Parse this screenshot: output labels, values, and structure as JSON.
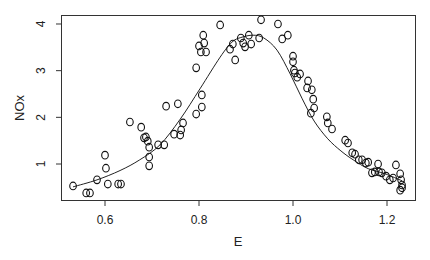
{
  "chart_data": {
    "type": "scatter",
    "title": "",
    "xlabel": "E",
    "ylabel": "NOx",
    "xlim": [
      0.52,
      1.26
    ],
    "ylim": [
      0.21,
      4.17
    ],
    "grid": false,
    "legend": null,
    "x_ticks": [
      0.6,
      0.8,
      1.0,
      1.2
    ],
    "x_tick_labels": [
      "0.6",
      "0.8",
      "1.0",
      "1.2"
    ],
    "y_ticks": [
      1,
      2,
      3,
      4
    ],
    "y_tick_labels": [
      "1",
      "2",
      "3",
      "4"
    ],
    "marker": "open-circle",
    "series": [
      {
        "name": "observations",
        "points": [
          [
            0.532,
            0.53
          ],
          [
            0.56,
            0.38
          ],
          [
            0.568,
            0.38
          ],
          [
            0.583,
            0.66
          ],
          [
            0.6,
            1.19
          ],
          [
            0.602,
            0.91
          ],
          [
            0.606,
            0.57
          ],
          [
            0.628,
            0.57
          ],
          [
            0.634,
            0.57
          ],
          [
            0.653,
            1.9
          ],
          [
            0.677,
            1.79
          ],
          [
            0.683,
            1.56
          ],
          [
            0.687,
            1.58
          ],
          [
            0.691,
            1.49
          ],
          [
            0.694,
            1.36
          ],
          [
            0.694,
            1.15
          ],
          [
            0.694,
            0.96
          ],
          [
            0.713,
            1.41
          ],
          [
            0.726,
            1.41
          ],
          [
            0.73,
            2.24
          ],
          [
            0.747,
            1.64
          ],
          [
            0.755,
            2.29
          ],
          [
            0.76,
            1.62
          ],
          [
            0.762,
            1.73
          ],
          [
            0.766,
            1.88
          ],
          [
            0.794,
            2.07
          ],
          [
            0.806,
            2.22
          ],
          [
            0.806,
            2.48
          ],
          [
            0.794,
            3.06
          ],
          [
            0.8,
            3.53
          ],
          [
            0.804,
            3.4
          ],
          [
            0.809,
            3.76
          ],
          [
            0.811,
            3.59
          ],
          [
            0.815,
            3.4
          ],
          [
            0.845,
            3.98
          ],
          [
            0.866,
            3.46
          ],
          [
            0.872,
            3.57
          ],
          [
            0.877,
            3.23
          ],
          [
            0.889,
            3.7
          ],
          [
            0.894,
            3.59
          ],
          [
            0.898,
            3.51
          ],
          [
            0.906,
            3.76
          ],
          [
            0.911,
            3.57
          ],
          [
            0.928,
            3.7
          ],
          [
            0.932,
            4.09
          ],
          [
            0.968,
            4.0
          ],
          [
            0.977,
            3.68
          ],
          [
            0.989,
            3.76
          ],
          [
            1.0,
            3.31
          ],
          [
            1.0,
            3.19
          ],
          [
            1.002,
            3.01
          ],
          [
            1.004,
            2.95
          ],
          [
            1.009,
            2.86
          ],
          [
            1.015,
            2.93
          ],
          [
            1.032,
            2.78
          ],
          [
            1.03,
            2.63
          ],
          [
            1.04,
            2.59
          ],
          [
            1.043,
            2.39
          ],
          [
            1.045,
            2.2
          ],
          [
            1.038,
            2.09
          ],
          [
            1.072,
            2.01
          ],
          [
            1.074,
            1.88
          ],
          [
            1.083,
            1.75
          ],
          [
            1.111,
            1.51
          ],
          [
            1.117,
            1.45
          ],
          [
            1.126,
            1.24
          ],
          [
            1.132,
            1.21
          ],
          [
            1.14,
            1.09
          ],
          [
            1.147,
            1.09
          ],
          [
            1.155,
            1.02
          ],
          [
            1.16,
            1.04
          ],
          [
            1.181,
            1.0
          ],
          [
            1.168,
            0.81
          ],
          [
            1.174,
            0.83
          ],
          [
            1.183,
            0.83
          ],
          [
            1.189,
            0.81
          ],
          [
            1.198,
            0.74
          ],
          [
            1.206,
            0.66
          ],
          [
            1.219,
            0.98
          ],
          [
            1.213,
            0.7
          ],
          [
            1.228,
            0.79
          ],
          [
            1.23,
            0.66
          ],
          [
            1.232,
            0.55
          ],
          [
            1.228,
            0.44
          ],
          [
            1.232,
            0.49
          ]
        ]
      },
      {
        "name": "smooth fit",
        "type": "line",
        "points": [
          [
            0.532,
            0.51
          ],
          [
            0.583,
            0.66
          ],
          [
            0.632,
            0.86
          ],
          [
            0.674,
            1.09
          ],
          [
            0.717,
            1.41
          ],
          [
            0.76,
            1.96
          ],
          [
            0.802,
            2.61
          ],
          [
            0.845,
            3.29
          ],
          [
            0.87,
            3.61
          ],
          [
            0.889,
            3.71
          ],
          [
            0.915,
            3.76
          ],
          [
            0.938,
            3.7
          ],
          [
            0.966,
            3.44
          ],
          [
            0.994,
            2.93
          ],
          [
            1.019,
            2.41
          ],
          [
            1.045,
            1.92
          ],
          [
            1.074,
            1.54
          ],
          [
            1.102,
            1.28
          ],
          [
            1.128,
            1.09
          ],
          [
            1.16,
            0.9
          ],
          [
            1.196,
            0.79
          ],
          [
            1.232,
            0.64
          ]
        ]
      }
    ]
  },
  "axes": {
    "xlabel": "E",
    "ylabel": "NOx"
  }
}
